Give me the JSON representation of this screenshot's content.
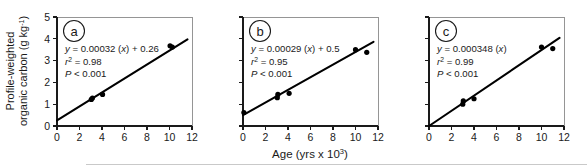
{
  "figure": {
    "y_axis_label_line1": "Profile-weighted",
    "y_axis_label_line2": "organic carbon (g kg",
    "y_axis_label_exponent": "-1",
    "y_axis_label_close": ")",
    "x_axis_label_main": "Age (yrs x 10",
    "x_axis_label_exponent": "3",
    "x_axis_label_close": ")"
  },
  "chart_data": [
    {
      "type": "scatter",
      "panel": "a",
      "title": "",
      "xlabel": "Age (yrs x 10^3)",
      "ylabel": "Profile-weighted organic carbon (g kg-1)",
      "xlim": [
        0,
        12
      ],
      "ylim": [
        0,
        5
      ],
      "xticks": [
        0,
        2,
        4,
        6,
        8,
        10,
        12
      ],
      "xticklabels": [
        "0",
        "2",
        "4",
        "6",
        "8",
        "10",
        "12"
      ],
      "yticks": [
        0,
        1,
        2,
        3,
        4,
        5
      ],
      "yticklabels": [
        "0",
        "1",
        "2",
        "3",
        "4",
        "5"
      ],
      "grid": false,
      "legend": null,
      "points": [
        {
          "x": 3.05,
          "y": 1.22
        },
        {
          "x": 3.15,
          "y": 1.28
        },
        {
          "x": 4.05,
          "y": 1.45
        },
        {
          "x": 10.05,
          "y": 3.68
        },
        {
          "x": 10.25,
          "y": 3.62
        }
      ],
      "fit": {
        "equation": "y = 0.00032 (x) + 0.26",
        "slope": 0.00032,
        "intercept": 0.26,
        "r2_label": "r2 = 0.98",
        "r2": 0.98,
        "p_label": "P < 0.001",
        "x_start": 0,
        "y_start": 0.26,
        "x_end": 11.6,
        "y_end": 3.97
      },
      "annotations": {
        "eq_line1_pre": "y",
        "eq_line1_mid": " = 0.00032 (",
        "eq_line1_var": "x",
        "eq_line1_post": ") + 0.26",
        "eq_line2_pre": "r",
        "eq_line2_sup": "2",
        "eq_line2_post": " = 0.98",
        "eq_line3_pre": "P",
        "eq_line3_post": " < 0.001"
      }
    },
    {
      "type": "scatter",
      "panel": "b",
      "title": "",
      "xlabel": "Age (yrs x 10^3)",
      "ylabel": "",
      "xlim": [
        0,
        12
      ],
      "ylim": [
        0,
        5
      ],
      "xticks": [
        0,
        2,
        4,
        6,
        8,
        10,
        12
      ],
      "xticklabels": [
        "0",
        "2",
        "4",
        "6",
        "8",
        "10",
        "12"
      ],
      "yticks": [
        0,
        1,
        2,
        3,
        4,
        5
      ],
      "yticklabels": [
        "",
        "",
        "",
        "",
        "",
        ""
      ],
      "grid": false,
      "legend": null,
      "points": [
        {
          "x": 0.08,
          "y": 0.62
        },
        {
          "x": 3.05,
          "y": 1.3
        },
        {
          "x": 3.1,
          "y": 1.45
        },
        {
          "x": 4.1,
          "y": 1.5
        },
        {
          "x": 10.0,
          "y": 3.5
        },
        {
          "x": 11.0,
          "y": 3.38
        }
      ],
      "fit": {
        "equation": "y = 0.00029 (x) + 0.5",
        "slope": 0.00029,
        "intercept": 0.5,
        "r2_label": "r2 = 0.95",
        "r2": 0.95,
        "p_label": "P < 0.001",
        "x_start": 0,
        "y_start": 0.5,
        "x_end": 11.6,
        "y_end": 3.86
      },
      "annotations": {
        "eq_line1_pre": "y",
        "eq_line1_mid": " = 0.00029 (",
        "eq_line1_var": "x",
        "eq_line1_post": ") + 0.5",
        "eq_line2_pre": "r",
        "eq_line2_sup": "2",
        "eq_line2_post": " = 0.95",
        "eq_line3_pre": "P",
        "eq_line3_post": " < 0.001"
      }
    },
    {
      "type": "scatter",
      "panel": "c",
      "title": "",
      "xlabel": "Age (yrs x 10^3)",
      "ylabel": "",
      "xlim": [
        0,
        12
      ],
      "ylim": [
        0,
        5
      ],
      "xticks": [
        0,
        2,
        4,
        6,
        8,
        10,
        12
      ],
      "xticklabels": [
        "0",
        "2",
        "4",
        "6",
        "8",
        "10",
        "12"
      ],
      "yticks": [
        0,
        1,
        2,
        3,
        4,
        5
      ],
      "yticklabels": [
        "",
        "",
        "",
        "",
        "",
        ""
      ],
      "grid": false,
      "legend": null,
      "points": [
        {
          "x": 3.0,
          "y": 1.0
        },
        {
          "x": 3.05,
          "y": 1.15
        },
        {
          "x": 4.0,
          "y": 1.25
        },
        {
          "x": 10.0,
          "y": 3.62
        },
        {
          "x": 11.0,
          "y": 3.55
        }
      ],
      "fit": {
        "equation": "y = 0.000348 (x)",
        "slope": 0.000348,
        "intercept": 0,
        "r2_label": "r2 = 0.99",
        "r2": 0.99,
        "p_label": "P < 0.001",
        "x_start": 0,
        "y_start": 0,
        "x_end": 11.6,
        "y_end": 4.04
      },
      "annotations": {
        "eq_line1_pre": "y",
        "eq_line1_mid": " = 0.000348 (",
        "eq_line1_var": "x",
        "eq_line1_post": ")",
        "eq_line2_pre": "r",
        "eq_line2_sup": "2",
        "eq_line2_post": " = 0.99",
        "eq_line3_pre": "P",
        "eq_line3_post": " < 0.001"
      }
    }
  ]
}
